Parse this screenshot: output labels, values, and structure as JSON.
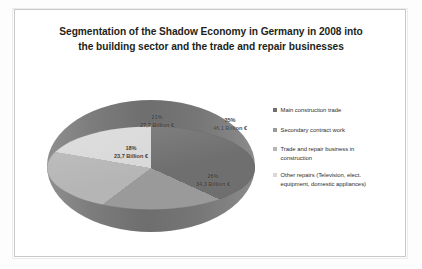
{
  "chart_data": {
    "type": "pie",
    "title": "Segmentation of the Shadow Economy in Germany in 2008 into the building sector and  the trade and repair businesses",
    "title_line1": "Segmentation of the Shadow Economy in Germany in 2008 into",
    "title_line2": "the building sector and  the trade and repair businesses",
    "unit": "Billion €",
    "legend_position": "right",
    "grid": false,
    "categories": [
      "Main construction trade",
      "Secondary contract work",
      "Trade and repair business in construction",
      "Other repairs (Television, elect. equipment, domestic appliances)"
    ],
    "values": [
      46.1,
      34.3,
      23.7,
      27.7
    ],
    "percentages": [
      35,
      26,
      18,
      21
    ],
    "colors": [
      "#6f6f6f",
      "#9a9a9a",
      "#b5b5b5",
      "#d8d8d8"
    ],
    "slices": [
      {
        "label": "Main construction trade",
        "percent_label": "35%",
        "value_label": "46,1 Billion €",
        "percent": 35,
        "value": 46.1,
        "color": "#6f6f6f"
      },
      {
        "label": "Secondary contract work",
        "percent_label": "26%",
        "value_label": "34,3 Billion €",
        "percent": 26,
        "value": 34.3,
        "color": "#9a9a9a"
      },
      {
        "label": "Trade and repair business in construction",
        "percent_label": "18%",
        "value_label": "23,7 Billion €",
        "percent": 18,
        "value": 23.7,
        "color": "#b5b5b5"
      },
      {
        "label": "Other repairs (Television, elect. equipment, domestic appliances)",
        "percent_label": "21%",
        "value_label": "27,7 Billion €",
        "percent": 21,
        "value": 27.7,
        "color": "#d8d8d8"
      }
    ]
  },
  "legend": {
    "items": [
      {
        "label": "Main construction trade",
        "line1": "Main construction trade",
        "line2": ""
      },
      {
        "label": "Secondary contract work",
        "line1": "Secondary contract work",
        "line2": ""
      },
      {
        "label": "Trade and repair business in construction",
        "line1": "Trade and repair business in",
        "line2": "construction"
      },
      {
        "label": "Other repairs (Television, elect. equipment, domestic appliances)",
        "line1": "Other repairs (Television, elect.",
        "line2": "equipment, domestic appliances)"
      }
    ]
  }
}
